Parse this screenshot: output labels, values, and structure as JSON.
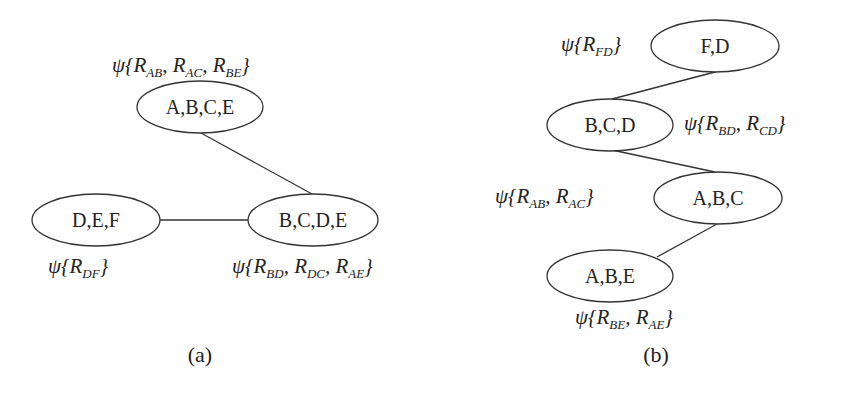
{
  "panels": {
    "a": {
      "caption": "(a)",
      "nodes": [
        {
          "id": "ABCE",
          "label": "A,B,C,E",
          "potential": {
            "prefix": "ψ{",
            "terms": [
              {
                "R": "R",
                "sub": "AB"
              },
              {
                "R": "R",
                "sub": "AC"
              },
              {
                "R": "R",
                "sub": "BE"
              }
            ],
            "suffix": "}"
          }
        },
        {
          "id": "DEF",
          "label": "D,E,F",
          "potential": {
            "prefix": "ψ{",
            "terms": [
              {
                "R": "R",
                "sub": "DF"
              }
            ],
            "suffix": "}"
          }
        },
        {
          "id": "BCDE",
          "label": "B,C,D,E",
          "potential": {
            "prefix": "ψ{",
            "terms": [
              {
                "R": "R",
                "sub": "BD"
              },
              {
                "R": "R",
                "sub": "DC"
              },
              {
                "R": "R",
                "sub": "AE"
              }
            ],
            "suffix": "}"
          }
        }
      ],
      "edges": [
        [
          "ABCE",
          "BCDE"
        ],
        [
          "DEF",
          "BCDE"
        ]
      ]
    },
    "b": {
      "caption": "(b)",
      "nodes": [
        {
          "id": "FD",
          "label": "F,D",
          "potential": {
            "prefix": "ψ{",
            "terms": [
              {
                "R": "R",
                "sub": "FD"
              }
            ],
            "suffix": "}"
          }
        },
        {
          "id": "BCD",
          "label": "B,C,D",
          "potential": {
            "prefix": "ψ{",
            "terms": [
              {
                "R": "R",
                "sub": "BD"
              },
              {
                "R": "R",
                "sub": "CD"
              }
            ],
            "suffix": "}"
          }
        },
        {
          "id": "ABC",
          "label": "A,B,C",
          "potential": {
            "prefix": "ψ{",
            "terms": [
              {
                "R": "R",
                "sub": "AB"
              },
              {
                "R": "R",
                "sub": "AC"
              }
            ],
            "suffix": "}"
          }
        },
        {
          "id": "ABE",
          "label": "A,B,E",
          "potential": {
            "prefix": "ψ{",
            "terms": [
              {
                "R": "R",
                "sub": "BE"
              },
              {
                "R": "R",
                "sub": "AE"
              }
            ],
            "suffix": "}"
          }
        }
      ],
      "edges": [
        [
          "FD",
          "BCD"
        ],
        [
          "BCD",
          "ABC"
        ],
        [
          "ABC",
          "ABE"
        ]
      ]
    }
  }
}
